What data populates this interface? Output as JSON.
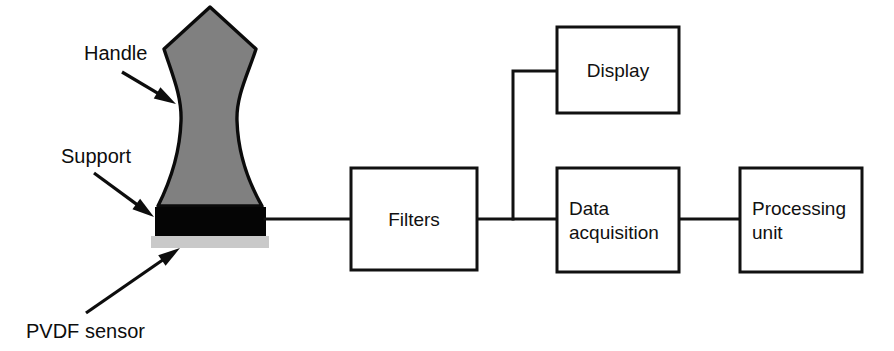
{
  "figure": {
    "domain": "diagram",
    "type": "measurement-system-block-diagram",
    "background_color": "#ffffff",
    "line_color": "#111111"
  },
  "annotations": [
    {
      "id": "handle",
      "label": "Handle",
      "text_x": 84,
      "text_y": 60,
      "arrow": {
        "x1": 122,
        "y1": 72,
        "x2": 176,
        "y2": 104
      }
    },
    {
      "id": "support",
      "label": "Support",
      "text_x": 61,
      "text_y": 163,
      "arrow": {
        "x1": 94,
        "y1": 173,
        "x2": 154,
        "y2": 217
      }
    },
    {
      "id": "pvdf-sensor",
      "label": "PVDF sensor",
      "text_x": 26,
      "text_y": 338,
      "arrow": {
        "x1": 86,
        "y1": 313,
        "x2": 180,
        "y2": 248
      }
    }
  ],
  "sensor_assembly": {
    "handle": {
      "name": "handle",
      "fill_color": "#808080",
      "outline_color": "#0b0b0b",
      "path": "M 210 7 L 256 49 C 248 74 236 96 237 121 C 238 152 246 178 262 206 L 158 206 C 172 178 180 152 181 121 C 182 96 172 74 164 49 Z"
    },
    "support": {
      "name": "support",
      "fill_color": "#050505",
      "x": 155,
      "y": 207,
      "width": 111,
      "height": 29
    },
    "pvdf_sensor": {
      "name": "pvdf-sensor",
      "fill_color": "#c9c9c9",
      "x": 151,
      "y": 236,
      "width": 118,
      "height": 12
    }
  },
  "blocks": [
    {
      "id": "filters",
      "lines": [
        "Filters"
      ],
      "align": "center",
      "x": 351,
      "y": 168,
      "width": 126,
      "height": 102
    },
    {
      "id": "display",
      "lines": [
        "Display"
      ],
      "align": "center",
      "x": 557,
      "y": 27,
      "width": 122,
      "height": 86
    },
    {
      "id": "data-acquisition",
      "lines": [
        "Data",
        "acquisition"
      ],
      "align": "left",
      "x": 557,
      "y": 168,
      "width": 122,
      "height": 104
    },
    {
      "id": "processing-unit",
      "lines": [
        "Processing",
        "unit"
      ],
      "align": "left",
      "x": 740,
      "y": 168,
      "width": 122,
      "height": 104
    }
  ],
  "connectors": [
    {
      "id": "sensor-to-filters",
      "path": "M 265 219 L 351 219"
    },
    {
      "id": "filters-to-daq",
      "path": "M 477 219 L 557 219"
    },
    {
      "id": "daq-to-processing",
      "path": "M 679 219 L 740 219"
    },
    {
      "id": "branch-to-display",
      "path": "M 513 219 L 513 71 L 557 71"
    }
  ]
}
